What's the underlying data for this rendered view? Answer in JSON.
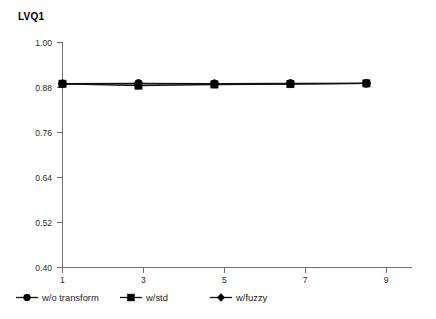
{
  "chart_data": {
    "type": "line",
    "title": "LVQ1",
    "xlabel": "",
    "ylabel": "",
    "x": [
      1,
      3,
      5,
      7,
      9
    ],
    "xlim": [
      1,
      10.2
    ],
    "ylim": [
      0.4,
      1.0
    ],
    "xticks": [
      "1",
      "3",
      "5",
      "7",
      "9"
    ],
    "yticks": [
      "1.00",
      "0.88",
      "0.76",
      "0.64",
      "0.52",
      "0.40"
    ],
    "ytick_values": [
      1.0,
      0.88,
      0.76,
      0.64,
      0.52,
      0.4
    ],
    "grid": false,
    "legend_position": "below-axis",
    "series": [
      {
        "name": "w/o transform",
        "marker": "circle",
        "values": [
          0.89,
          0.891,
          0.89,
          0.891,
          0.891
        ]
      },
      {
        "name": "w/std",
        "marker": "square",
        "values": [
          0.89,
          0.885,
          0.888,
          0.889,
          0.891
        ]
      },
      {
        "name": "w/fuzzy",
        "marker": "diamond",
        "values": [
          0.89,
          0.89,
          0.89,
          0.89,
          0.891
        ]
      }
    ]
  },
  "colors": {
    "series_line": "#111111",
    "marker": "#000000",
    "axis": "#6f6f6f",
    "background": "#ffffff",
    "text": "#1a1a1a"
  },
  "axis": {
    "y_tick_labels": [
      "1.00",
      "0.88",
      "0.76",
      "0.64",
      "0.52",
      "0.40"
    ],
    "x_tick_labels": [
      "1",
      "3",
      "5",
      "7",
      "9"
    ]
  },
  "legend": {
    "items": [
      {
        "label": "w/o transform",
        "marker": "circle"
      },
      {
        "label": "w/std",
        "marker": "square"
      },
      {
        "label": "w/fuzzy",
        "marker": "diamond"
      }
    ]
  }
}
